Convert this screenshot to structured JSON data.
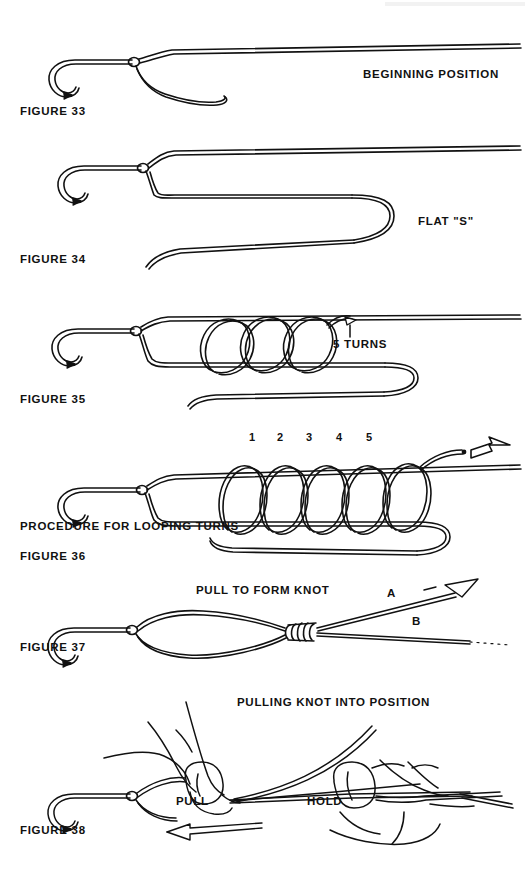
{
  "document": {
    "title": "Fishing Knot Tying Instructions",
    "background_color": "#ffffff",
    "ink_color": "#111111",
    "page_width": 529,
    "page_height": 874
  },
  "figures": [
    {
      "id": "figure-33",
      "caption": "FIGURE 33",
      "label": "BEGINNING POSITION",
      "description": "Hook with line laid alongside shank forming start of knot"
    },
    {
      "id": "figure-34",
      "caption": "FIGURE 34",
      "label": "FLAT \"S\"",
      "description": "Line doubled back on itself forming a flat S shape"
    },
    {
      "id": "figure-35",
      "caption": "FIGURE 35",
      "label": "5 TURNS",
      "description": "Tag end wrapped around the doubled line making turns"
    },
    {
      "id": "figure-36",
      "caption": "FIGURE 36",
      "label": "PROCEDURE FOR LOOPING TURNS",
      "turn_numbers": [
        "1",
        "2",
        "3",
        "4",
        "5"
      ],
      "description": "Five numbered coils around the doubled line with direction arrow"
    },
    {
      "id": "figure-37",
      "caption": "FIGURE 37",
      "label": "PULL TO FORM KNOT",
      "line_a": "A",
      "line_b": "B",
      "description": "Loop cinched into a formed knot with lines A and B"
    },
    {
      "id": "figure-38",
      "caption": "FIGURE 38",
      "label": "PULLING KNOT INTO POSITION",
      "action_pull": "PULL",
      "action_hold": "HOLD",
      "description": "Two hands pulling and holding line to seat the knot"
    }
  ]
}
